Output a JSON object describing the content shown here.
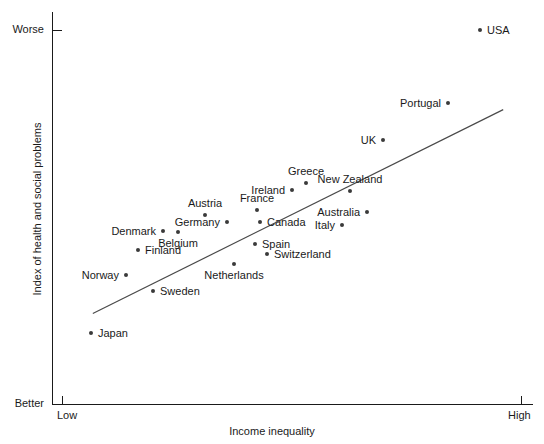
{
  "chart_data": {
    "type": "scatter",
    "title": "",
    "xlabel": "Income inequality",
    "ylabel": "Index of health and social problems",
    "x_tick_labels": [
      "Low",
      "High"
    ],
    "y_tick_labels": [
      "Worse",
      "Better"
    ],
    "grid": false,
    "legend": "none",
    "xlim": [
      0,
      100
    ],
    "ylim": [
      0,
      100
    ],
    "trendline": {
      "x0": 8.5,
      "y0": 24.2,
      "x1": 94.0,
      "y1": 78.7
    },
    "points": [
      {
        "name": "Japan",
        "x": 8.3,
        "y": 18.1,
        "px": 91,
        "py": 333,
        "label_pos": "right"
      },
      {
        "name": "Norway",
        "x": 15.8,
        "y": 32.9,
        "px": 126,
        "py": 275,
        "label_pos": "left"
      },
      {
        "name": "Sweden",
        "x": 21.4,
        "y": 28.8,
        "px": 153,
        "py": 291,
        "label_pos": "right"
      },
      {
        "name": "Finland",
        "x": 18.3,
        "y": 39.2,
        "px": 138,
        "py": 250,
        "label_pos": "right"
      },
      {
        "name": "Denmark",
        "x": 23.5,
        "y": 44.0,
        "px": 163,
        "py": 231,
        "label_pos": "left"
      },
      {
        "name": "Belgium",
        "x": 26.6,
        "y": 44.2,
        "px": 178,
        "py": 232,
        "label_pos": "below"
      },
      {
        "name": "Austria",
        "x": 32.2,
        "y": 48.6,
        "px": 205,
        "py": 215,
        "label_pos": "above"
      },
      {
        "name": "Germany",
        "x": 36.8,
        "y": 46.8,
        "px": 227,
        "py": 222,
        "label_pos": "left"
      },
      {
        "name": "Netherlands",
        "x": 38.3,
        "y": 36.1,
        "px": 234,
        "py": 264,
        "label_pos": "below"
      },
      {
        "name": "Spain",
        "x": 42.6,
        "y": 41.3,
        "px": 255,
        "py": 244,
        "label_pos": "right"
      },
      {
        "name": "Switzerland",
        "x": 45.1,
        "y": 38.7,
        "px": 267,
        "py": 254,
        "label_pos": "right"
      },
      {
        "name": "France",
        "x": 43.0,
        "y": 50.1,
        "px": 257,
        "py": 210,
        "label_pos": "above"
      },
      {
        "name": "Canada",
        "x": 43.6,
        "y": 47.1,
        "px": 260,
        "py": 222,
        "label_pos": "right"
      },
      {
        "name": "Ireland",
        "x": 50.2,
        "y": 55.4,
        "px": 292,
        "py": 190,
        "label_pos": "left"
      },
      {
        "name": "Greece",
        "x": 53.2,
        "y": 57.2,
        "px": 306,
        "py": 183,
        "label_pos": "above"
      },
      {
        "name": "Italy",
        "x": 60.7,
        "y": 46.4,
        "px": 342,
        "py": 225,
        "label_pos": "left"
      },
      {
        "name": "New Zealand",
        "x": 62.4,
        "y": 55.2,
        "px": 350,
        "py": 191,
        "label_pos": "above"
      },
      {
        "name": "Australia",
        "x": 65.9,
        "y": 49.9,
        "px": 367,
        "py": 212,
        "label_pos": "left"
      },
      {
        "name": "UK",
        "x": 69.3,
        "y": 68.9,
        "px": 383,
        "py": 140,
        "label_pos": "left"
      },
      {
        "name": "Portugal",
        "x": 82.9,
        "y": 78.5,
        "px": 448,
        "py": 103,
        "label_pos": "left"
      },
      {
        "name": "USA",
        "x": 89.6,
        "y": 97.2,
        "px": 480,
        "py": 30,
        "label_pos": "right"
      }
    ]
  },
  "axis": {
    "x_title": "Income inequality",
    "y_title": "Index of health and social problems",
    "x_low": "Low",
    "x_high": "High",
    "y_worse": "Worse",
    "y_better": "Better"
  },
  "colors": {
    "point": "#3a3a3a",
    "axis": "#1a1a1a",
    "trendline": "#4a4a4a",
    "background": "#ffffff"
  }
}
